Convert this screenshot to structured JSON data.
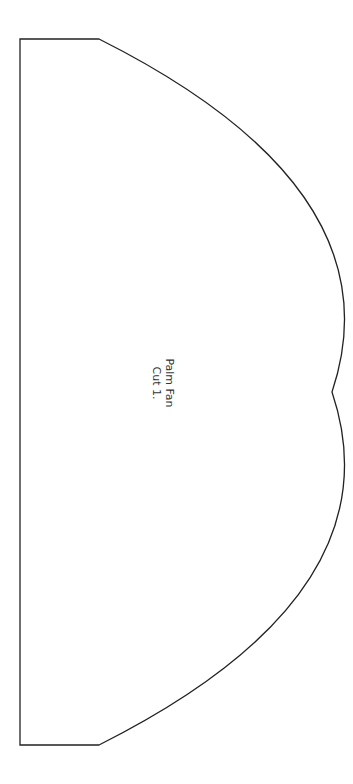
{
  "pattern": {
    "name": "Palm Fan",
    "instruction": "Cut 1.",
    "stroke_color": "#222222",
    "background": "#ffffff"
  }
}
